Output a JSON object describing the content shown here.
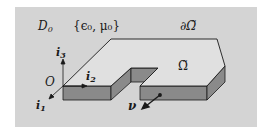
{
  "figure": {
    "colors": {
      "background": "#d4d4d4",
      "top_face": "#e0e0e0",
      "side_face": "#8a8a8a",
      "edge": "#1a1a1a",
      "outer": "#ffffff"
    },
    "labels": {
      "domain": "D",
      "domain_sub": "0",
      "params": "{ϵ₀, μ₀}",
      "boundary": "∂Ω̃",
      "region": "Ω̃",
      "origin": "O",
      "axis_i1": "i",
      "axis_i1_sub": "1",
      "axis_i2": "i",
      "axis_i2_sub": "2",
      "axis_i3": "i",
      "axis_i3_sub": "3",
      "normal": "ν"
    }
  }
}
